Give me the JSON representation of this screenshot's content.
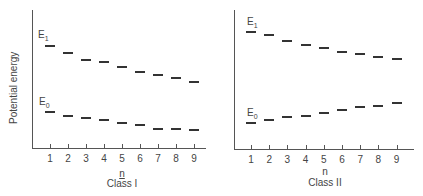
{
  "chart_data": [
    {
      "type": "scatter",
      "title": "",
      "xlabel": "n",
      "ylabel": "Potential energy",
      "class_label": "Class I",
      "categories": [
        1,
        2,
        3,
        4,
        5,
        6,
        7,
        8,
        9
      ],
      "ylim": [
        0,
        100
      ],
      "grid": false,
      "marker": "horizontal-dash",
      "series": [
        {
          "name": "E1",
          "values": [
            74,
            69,
            64,
            62,
            59,
            55,
            53,
            51,
            48
          ]
        },
        {
          "name": "E0",
          "values": [
            26,
            23,
            22,
            20,
            18,
            17,
            14,
            14,
            13
          ]
        }
      ]
    },
    {
      "type": "scatter",
      "title": "",
      "xlabel": "n",
      "ylabel": "",
      "class_label": "Class II",
      "categories": [
        1,
        2,
        3,
        4,
        5,
        6,
        7,
        8,
        9
      ],
      "ylim": [
        0,
        100
      ],
      "grid": false,
      "marker": "horizontal-dash",
      "series": [
        {
          "name": "E1",
          "values": [
            84,
            82,
            78,
            75,
            73,
            70,
            68,
            66,
            65
          ]
        },
        {
          "name": "E0",
          "values": [
            19,
            21,
            23,
            24,
            26,
            28,
            30,
            31,
            33
          ]
        }
      ]
    }
  ],
  "labels": {
    "ylabel": "Potential energy",
    "e1": "E",
    "e1_sub": "1",
    "e0": "E",
    "e0_sub": "0",
    "xlabel": "n",
    "class1": "Class I",
    "class2": "Class II"
  },
  "ticks": [
    "1",
    "2",
    "3",
    "4",
    "5",
    "6",
    "7",
    "8",
    "9"
  ]
}
